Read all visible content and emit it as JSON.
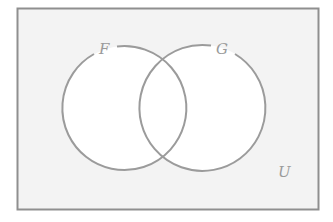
{
  "diagram": {
    "type": "venn",
    "universe": {
      "label": "U"
    },
    "sets": [
      {
        "label": "F"
      },
      {
        "label": "G"
      }
    ],
    "colors": {
      "stroke": "#9b9b9b",
      "frame": "#8f8f8f",
      "background": "#f3f3f3",
      "circle_fill": "#ffffff",
      "label": "#9a9a9a"
    }
  }
}
